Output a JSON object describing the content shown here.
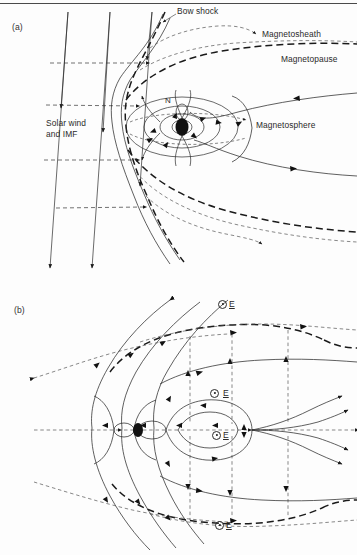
{
  "figure": {
    "domain": "scientific-diagram",
    "background_color": "#fdfdfd",
    "ink_color": "#1a1a1a",
    "width": 357,
    "height": 555,
    "top_rule": true
  },
  "panels": [
    {
      "id": "a",
      "label": "(a)",
      "caption": "Closed magnetosphere: solar wind and IMF draping around the magnetopause",
      "labels": [
        {
          "name": "bow-shock",
          "text": "Bow shock",
          "x": 177,
          "y": 10,
          "leader": true
        },
        {
          "name": "magnetosheath",
          "text": "Magnetosheath",
          "x": 262,
          "y": 33,
          "leader": true
        },
        {
          "name": "magnetopause",
          "text": "Magnetopause",
          "x": 283,
          "y": 58,
          "leader": false
        },
        {
          "name": "solar-wind-imf",
          "text": "Solar wind\nand IMF",
          "x": 48,
          "y": 122,
          "leader": false
        },
        {
          "name": "magnetosphere",
          "text": "Magnetosphere",
          "x": 258,
          "y": 124,
          "leader": false
        },
        {
          "name": "north-pole",
          "text": "N",
          "x": 166,
          "y": 100,
          "leader": false
        }
      ],
      "features": [
        "three slanted interplanetary magnetic field lines with downward arrowheads",
        "four horizontal dashed solar-wind flow arrows",
        "wavy bow shock surface",
        "heavy dashed magnetopause boundary",
        "dashed magnetosheath streamlines",
        "dipolar closed geomagnetic field lines around Earth",
        "stretched magnetotail field lines with sunward arrows",
        "Earth shown as filled black ellipse"
      ]
    },
    {
      "id": "b",
      "label": "(b)",
      "caption": "Open magnetosphere: reconnection geometry with convection electric field out of the page",
      "labels": [
        {
          "name": "panel-b-label",
          "text": "(b)",
          "x": 28,
          "y": 308
        }
      ],
      "efield_labels": [
        {
          "name": "efield-label-1",
          "symbol": "⊙",
          "vector": "E",
          "x": 218,
          "y": 303,
          "spaced": false
        },
        {
          "name": "efield-label-2",
          "symbol": "⊙",
          "vector": "E",
          "x": 210,
          "y": 392,
          "spaced": true
        },
        {
          "name": "efield-label-3",
          "symbol": "⊙",
          "vector": "E",
          "x": 212,
          "y": 434,
          "spaced": false
        },
        {
          "name": "efield-label-4",
          "symbol": "⊙",
          "vector": "E",
          "x": 215,
          "y": 524,
          "spaced": false
        }
      ],
      "features": [
        "open field lines connected to the interplanetary magnetic field",
        "dayside reconnection at the subsolar magnetopause",
        "dashed plasma convection streamlines with arrowheads",
        "distant neutral line (X-point) in the magnetotail",
        "tailward and earthward outflow jets from the neutral line",
        "heavy dashed magnetopause boundary",
        "Earth shown as small filled black ellipse"
      ]
    }
  ]
}
